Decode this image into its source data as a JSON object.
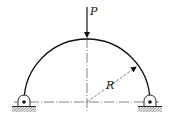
{
  "diagram": {
    "type": "semicircular arch with two pin supports",
    "labels": {
      "load": "P",
      "radius": "R"
    },
    "colors": {
      "stroke": "#111111",
      "background": "#ffffff"
    }
  }
}
